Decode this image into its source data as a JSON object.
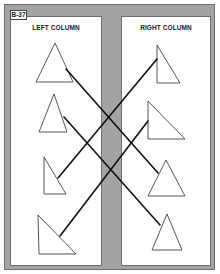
{
  "figure": {
    "label": "B-37",
    "left_column": {
      "title": "LEFT COLUMN"
    },
    "right_column": {
      "title": "RIGHT COLUMN"
    }
  },
  "colors": {
    "frame": "#a3a3a3",
    "panel": "#ffffff",
    "stroke": "#444444",
    "line": "#111111"
  },
  "shapes": {
    "left": [
      {
        "id": "L1",
        "type": "isosceles-triangle",
        "points": "55,43 36,82 73,82"
      },
      {
        "id": "L2",
        "type": "isosceles-triangle",
        "points": "54,94 39,132 67,132"
      },
      {
        "id": "L3",
        "type": "right-triangle",
        "points": "44,157 44,194 66,194"
      },
      {
        "id": "L4",
        "type": "right-triangle",
        "points": "38,215 39,254 76,254"
      }
    ],
    "right": [
      {
        "id": "R1",
        "type": "right-triangle",
        "points": "157,45 157,83 180,83"
      },
      {
        "id": "R2",
        "type": "right-triangle",
        "points": "148,101 148,139 185,139"
      },
      {
        "id": "R3",
        "type": "isosceles-triangle",
        "points": "166,160 148,196 185,196"
      },
      {
        "id": "R4",
        "type": "isosceles-triangle",
        "points": "167,214 152,250 182,250"
      }
    ]
  },
  "connections": [
    {
      "from": "L1",
      "to": "R3",
      "x1": 66,
      "y1": 69,
      "x2": 158,
      "y2": 173
    },
    {
      "from": "L2",
      "to": "R4",
      "x1": 64,
      "y1": 117,
      "x2": 160,
      "y2": 225
    },
    {
      "from": "L3",
      "to": "R1",
      "x1": 58,
      "y1": 178,
      "x2": 157,
      "y2": 59
    },
    {
      "from": "L4",
      "to": "R2",
      "x1": 60,
      "y1": 236,
      "x2": 148,
      "y2": 121
    }
  ]
}
